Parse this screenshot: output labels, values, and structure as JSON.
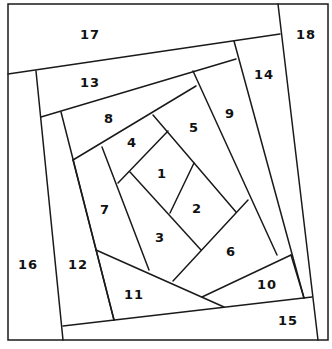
{
  "diagram": {
    "type": "foundation-paper-piecing-pattern",
    "stroke_color": "#1a1a1a",
    "background": "#ffffff",
    "pieces": [
      {
        "label": "1",
        "x": 162,
        "y": 173
      },
      {
        "label": "2",
        "x": 197,
        "y": 208
      },
      {
        "label": "3",
        "x": 160,
        "y": 237
      },
      {
        "label": "4",
        "x": 132,
        "y": 142
      },
      {
        "label": "5",
        "x": 194,
        "y": 127
      },
      {
        "label": "6",
        "x": 231,
        "y": 251
      },
      {
        "label": "7",
        "x": 105,
        "y": 209
      },
      {
        "label": "8",
        "x": 109,
        "y": 118
      },
      {
        "label": "9",
        "x": 230,
        "y": 113
      },
      {
        "label": "10",
        "x": 267,
        "y": 284
      },
      {
        "label": "11",
        "x": 134,
        "y": 294
      },
      {
        "label": "12",
        "x": 78,
        "y": 264
      },
      {
        "label": "13",
        "x": 90,
        "y": 82
      },
      {
        "label": "14",
        "x": 264,
        "y": 74
      },
      {
        "label": "15",
        "x": 288,
        "y": 320
      },
      {
        "label": "16",
        "x": 28,
        "y": 264
      },
      {
        "label": "17",
        "x": 90,
        "y": 34
      },
      {
        "label": "18",
        "x": 306,
        "y": 34
      }
    ]
  }
}
